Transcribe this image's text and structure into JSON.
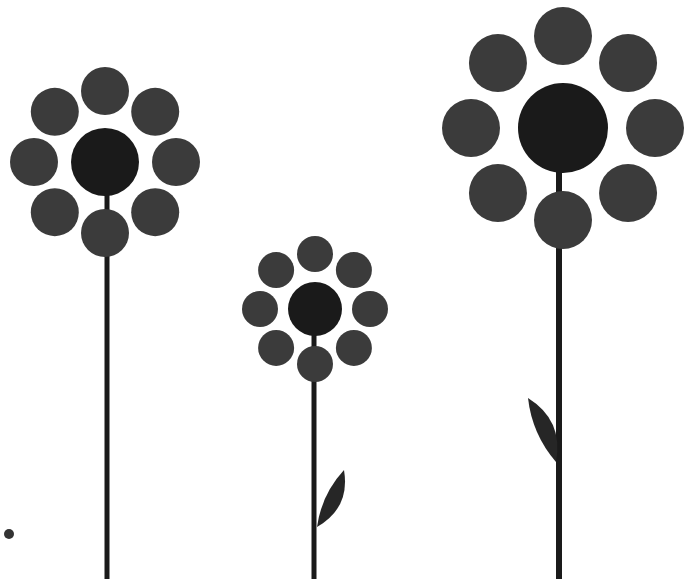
{
  "scene": {
    "title": "Stylized Flowers Illustration",
    "width": 693,
    "height": 579,
    "background_color": "#ffffff",
    "petal_color": "#3b3b3b",
    "center_color": "#1a1a1a",
    "stem_color": "#1a1a1a",
    "leaf_color": "#262626",
    "accent_dot_color": "#333333",
    "petal_count_each": 8,
    "flower_count": 3
  },
  "flowers": [
    {
      "name": "flower-left",
      "label": "Tall left flower",
      "center_x": 105,
      "center_y": 162,
      "center_radius": 34,
      "petal_radius": 24,
      "ring_radius": 71,
      "petal_count": 8,
      "petal_start_angle_deg": -90,
      "stem_x": 107,
      "stem_top": 190,
      "stem_bottom": 579,
      "stem_width": 5,
      "leaf": null
    },
    {
      "name": "flower-middle",
      "label": "Short middle flower",
      "center_x": 315,
      "center_y": 309,
      "center_radius": 27,
      "petal_radius": 18,
      "ring_radius": 55,
      "petal_count": 8,
      "petal_start_angle_deg": -90,
      "stem_x": 314,
      "stem_top": 330,
      "stem_bottom": 579,
      "stem_width": 5,
      "leaf": {
        "name": "leaf-middle",
        "side": "right",
        "attach_x": 317,
        "attach_y": 527,
        "tip_x": 344,
        "tip_y": 470,
        "width": 22
      }
    },
    {
      "name": "flower-right",
      "label": "Large right flower",
      "center_x": 563,
      "center_y": 128,
      "center_radius": 45,
      "petal_radius": 29,
      "ring_radius": 92,
      "petal_count": 8,
      "petal_start_angle_deg": -90,
      "stem_x": 559,
      "stem_top": 160,
      "stem_bottom": 579,
      "stem_width": 6,
      "leaf": {
        "name": "leaf-right",
        "side": "left",
        "attach_x": 556,
        "attach_y": 462,
        "tip_x": 528,
        "tip_y": 398,
        "width": 24
      }
    }
  ],
  "accent_dot": {
    "name": "accent-dot",
    "label": "Small dot lower-left",
    "center_x": 9,
    "center_y": 534,
    "radius": 5
  }
}
